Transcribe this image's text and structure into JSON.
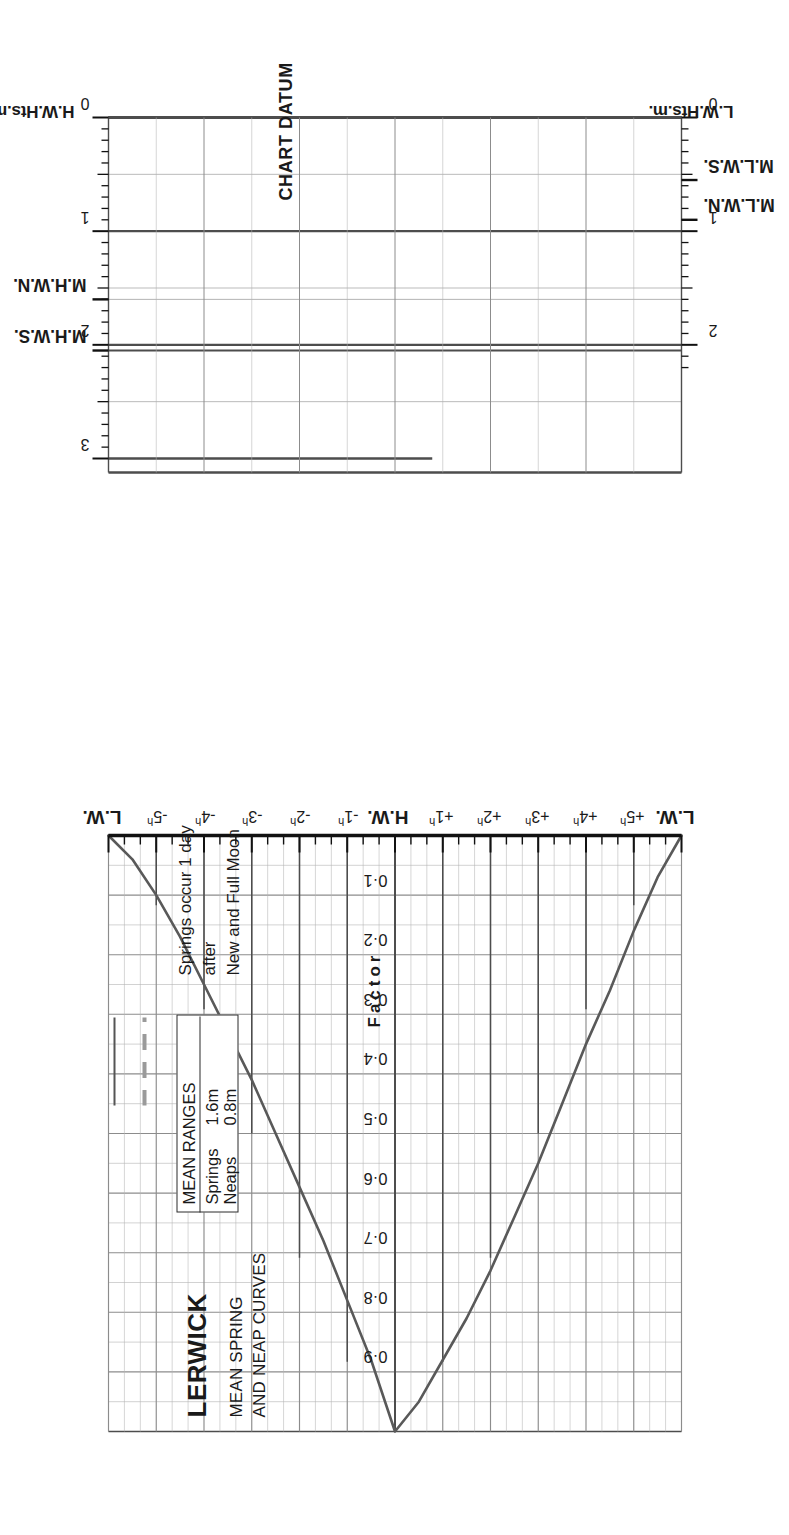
{
  "header": {
    "title": "LERWICK",
    "subtitle_line1": "MEAN SPRING",
    "subtitle_line2": "AND NEAP CURVES"
  },
  "legend": {
    "heading": "MEAN RANGES",
    "rows": [
      {
        "name": "Springs",
        "value": "1.6m",
        "style": "solid"
      },
      {
        "name": "Neaps",
        "value": "0.8m",
        "style": "dashed"
      }
    ]
  },
  "note": {
    "line1": "Springs occur 1 day",
    "line2": "after",
    "line3": "New and Full Moon"
  },
  "axes": {
    "factor_title": "Factor",
    "factor_labels": [
      "0·1",
      "0·2",
      "0·3",
      "0·4",
      "0·5",
      "0·6",
      "0·7",
      "0·8",
      "0·9"
    ],
    "time_labels": [
      "L.W.",
      "-5",
      "-4",
      "-3",
      "-2",
      "-1",
      "H.W.",
      "+1",
      "+2",
      "+3",
      "+4",
      "+5",
      "L.W."
    ],
    "time_suffix": "h",
    "hw_axis_name": "H.W.Hts.m.",
    "lw_axis_name": "L.W.Hts.m.",
    "hw_tick_labels": [
      "0",
      "1",
      "2",
      "3"
    ],
    "lw_tick_labels": [
      "0",
      "1",
      "2"
    ],
    "chart_datum": "CHART DATUM"
  },
  "markers": {
    "mhws": "M.H.W.S.",
    "mhwn": "M.H.W.N.",
    "mlwn": "M.L.W.N.",
    "mlws": "M.L.W.S."
  },
  "colors": {
    "ink": "#1a1a1a",
    "curve": "#595959",
    "grid_major": "#4d4d4d",
    "grid_minor": "#8c8c8c",
    "grid_faint": "#b3b3b3",
    "paper": "#ffffff"
  },
  "chart_data": {
    "type": "line",
    "subtitle": "Tidal curve / factor diagram",
    "xlabel": "Hours relative to High Water",
    "ylabel": "Factor",
    "xlim": [
      -6,
      6
    ],
    "ylim": [
      0,
      1
    ],
    "grid": true,
    "legend_position": "top-left",
    "mean_ranges": {
      "springs_m": 1.6,
      "neaps_m": 0.8
    },
    "height_scales": {
      "hw_heights_m": [
        0,
        1,
        2,
        3
      ],
      "lw_heights_m": [
        0,
        1,
        2
      ],
      "mhws_m": 2.05,
      "mhwn_m": 1.6,
      "mlwn_m": 0.9,
      "mlws_m": 0.55,
      "chart_datum_m": 0
    },
    "x": [
      -6,
      -5.5,
      -5,
      -4.5,
      -4,
      -3.5,
      -3,
      -2.5,
      -2,
      -1.5,
      -1,
      -0.5,
      0,
      0.5,
      1,
      1.5,
      2,
      2.5,
      3,
      3.5,
      4,
      4.5,
      5,
      5.5,
      6
    ],
    "series": [
      {
        "name": "Springs",
        "style": "solid",
        "values": [
          0.0,
          0.04,
          0.1,
          0.17,
          0.25,
          0.33,
          0.41,
          0.5,
          0.59,
          0.68,
          0.78,
          0.88,
          1.0,
          0.95,
          0.88,
          0.81,
          0.73,
          0.64,
          0.55,
          0.45,
          0.35,
          0.26,
          0.16,
          0.07,
          0.0
        ]
      },
      {
        "name": "Neaps",
        "style": "dashed",
        "values": [
          0.0,
          0.04,
          0.1,
          0.17,
          0.25,
          0.33,
          0.41,
          0.5,
          0.59,
          0.68,
          0.78,
          0.88,
          1.0,
          0.95,
          0.88,
          0.81,
          0.73,
          0.64,
          0.55,
          0.45,
          0.35,
          0.26,
          0.16,
          0.07,
          0.0
        ]
      }
    ]
  }
}
